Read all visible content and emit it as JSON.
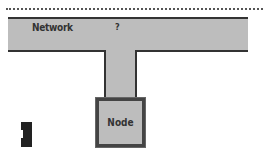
{
  "diagram": {
    "network": {
      "label": "Network"
    },
    "link": {
      "label": "?"
    },
    "node": {
      "label": "Node"
    }
  },
  "colors": {
    "fill": "#bdbdbd",
    "stroke": "#333333",
    "block": "#222222"
  }
}
